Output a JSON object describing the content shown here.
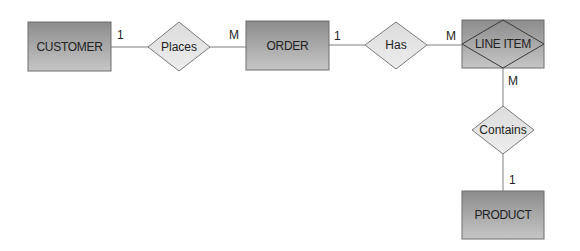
{
  "diagram": {
    "type": "entity-relationship",
    "colors": {
      "entity_fill_top": "#8c8c8c",
      "entity_fill_bottom": "#c4c4c4",
      "entity_border": "#6e6e6e",
      "relationship_fill": "#e6e6e6",
      "relationship_border": "#7a7a7a",
      "line": "#808080",
      "text": "#222222"
    },
    "entities": [
      {
        "id": "customer",
        "label": "CUSTOMER",
        "weak": false
      },
      {
        "id": "order",
        "label": "ORDER",
        "weak": false
      },
      {
        "id": "line_item",
        "label": "LINE ITEM",
        "weak": true
      },
      {
        "id": "product",
        "label": "PRODUCT",
        "weak": false
      }
    ],
    "relationships": [
      {
        "id": "places",
        "label": "Places",
        "from": "customer",
        "to": "order",
        "from_card": "1",
        "to_card": "M"
      },
      {
        "id": "has",
        "label": "Has",
        "from": "order",
        "to": "line_item",
        "from_card": "1",
        "to_card": "M"
      },
      {
        "id": "contains",
        "label": "Contains",
        "from": "line_item",
        "to": "product",
        "from_card": "M",
        "to_card": "1"
      }
    ]
  }
}
